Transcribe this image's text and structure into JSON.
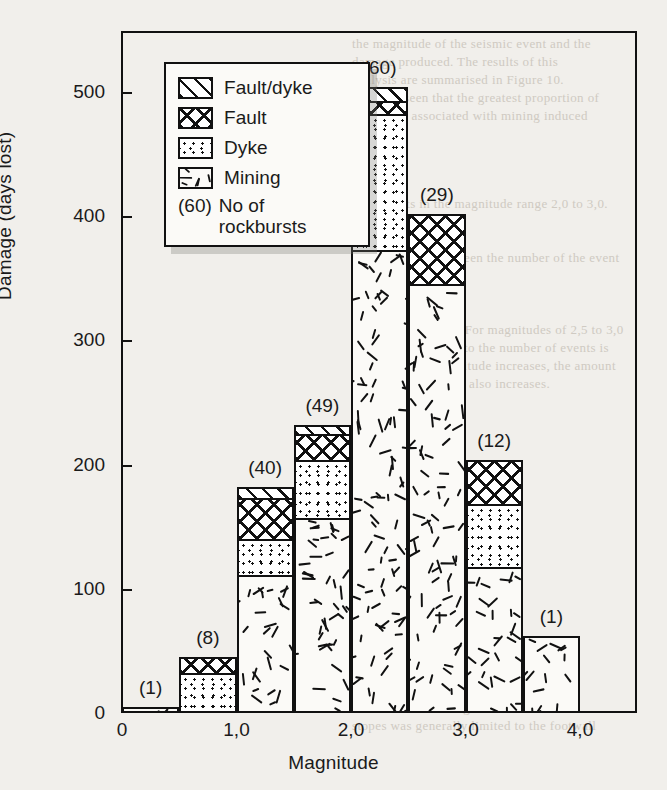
{
  "chart_data": {
    "type": "bar",
    "subtype": "stacked-histogram",
    "title": "",
    "xlabel": "Magnitude",
    "ylabel": "Damage (days lost)",
    "xlim": [
      0,
      4.5
    ],
    "ylim": [
      0,
      530
    ],
    "xticks": [
      "0",
      "1,0",
      "2,0",
      "3,0",
      "4,0"
    ],
    "xtick_values": [
      0,
      1,
      2,
      3,
      4
    ],
    "yticks": [
      "0",
      "100",
      "200",
      "300",
      "400",
      "500"
    ],
    "ytick_values": [
      0,
      100,
      200,
      300,
      400,
      500
    ],
    "grid": false,
    "bin_width": 0.5,
    "bins": [
      {
        "x0": 0.0,
        "x1": 0.5,
        "label": "(1)",
        "count": 1,
        "mining": 5,
        "dyke": 0,
        "fault": 0,
        "fault_dyke": 0,
        "total": 5
      },
      {
        "x0": 0.5,
        "x1": 1.0,
        "label": "(8)",
        "count": 8,
        "mining": 0,
        "dyke": 34,
        "fault": 11,
        "fault_dyke": 0,
        "total": 45
      },
      {
        "x0": 1.0,
        "x1": 1.5,
        "label": "(40)",
        "count": 40,
        "mining": 113,
        "dyke": 29,
        "fault": 33,
        "fault_dyke": 7,
        "total": 182
      },
      {
        "x0": 1.5,
        "x1": 2.0,
        "label": "(49)",
        "count": 49,
        "mining": 159,
        "dyke": 46,
        "fault": 21,
        "fault_dyke": 6,
        "total": 232
      },
      {
        "x0": 2.0,
        "x1": 2.5,
        "label": "(60)",
        "count": 60,
        "mining": 374,
        "dyke": 110,
        "fault": 10,
        "fault_dyke": 10,
        "total": 504
      },
      {
        "x0": 2.5,
        "x1": 3.0,
        "label": "(29)",
        "count": 29,
        "mining": 347,
        "dyke": 0,
        "fault": 55,
        "fault_dyke": 0,
        "total": 402
      },
      {
        "x0": 3.0,
        "x1": 3.5,
        "label": "(12)",
        "count": 12,
        "mining": 119,
        "dyke": 51,
        "fault": 34,
        "fault_dyke": 0,
        "total": 204
      },
      {
        "x0": 3.5,
        "x1": 4.0,
        "label": "(1)",
        "count": 1,
        "mining": 62,
        "dyke": 0,
        "fault": 0,
        "fault_dyke": 0,
        "total": 62
      }
    ],
    "series": [
      {
        "name": "Fault/dyke",
        "key": "fault_dyke",
        "pattern": "diagonal-hatch"
      },
      {
        "name": "Fault",
        "key": "fault",
        "pattern": "cross-hatch"
      },
      {
        "name": "Dyke",
        "key": "dyke",
        "pattern": "stipple"
      },
      {
        "name": "Mining",
        "key": "mining",
        "pattern": "short-dashes"
      }
    ],
    "legend": {
      "position": "upper-left-inset",
      "entries": [
        {
          "label": "Fault/dyke",
          "pattern": "diagonal-hatch"
        },
        {
          "label": "Fault",
          "pattern": "cross-hatch"
        },
        {
          "label": "Dyke",
          "pattern": "stipple"
        },
        {
          "label": "Mining",
          "pattern": "short-dashes"
        }
      ],
      "note_key": "(60)",
      "note_line1": "No of",
      "note_line2": "rockbursts"
    },
    "annotations": [
      "(1)",
      "(8)",
      "(40)",
      "(49)",
      "(60)",
      "(29)",
      "(12)",
      "(1)"
    ]
  },
  "colors": {
    "ink": "#111111",
    "paper": "#f1efeb",
    "fill": "#fbfaf7",
    "ghost": "#cfcac2"
  },
  "background_text": {
    "lines": [
      "the magnitude of the seismic event and the",
      "damage produced. The results of this",
      "analysis are summarised in Figure 10.",
      "It can be seen that the greatest proportion of",
      "damage is associated with mining induced",
      "events in the magnitude range 2,0 to 3,0.",
      "Note",
      "the correlation between the number of the event",
      "and 1 050 m levels. For magnitudes of 2,5 to 3,0",
      "the ratio of damage to the number of events is",
      "higher. As the magnitude increases, the amount",
      "of damage per event also increases.",
      "Rock",
      "The rockburst damage observed in the",
      "stopes was generally limited to the footwall"
    ]
  }
}
